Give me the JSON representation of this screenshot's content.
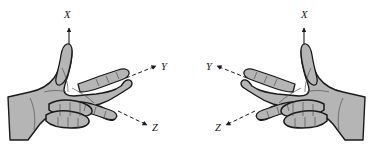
{
  "figure": {
    "background_color": "#ffffff",
    "hand_fill_color": "#b5b5b5",
    "hand_shade_color": "#9a9a9a",
    "outline_color": "#1a1a1a",
    "label_color": "#111111",
    "panels": [
      {
        "id": "left-panel",
        "hand": "left-oriented-hand",
        "axes": [
          {
            "id": "x",
            "label": "X",
            "direction": "up",
            "arrow_style": "solid-line-up",
            "label_x": 68,
            "label_y": 14
          },
          {
            "id": "y",
            "label": "Y",
            "direction": "upper-right",
            "arrow_style": "dashed-line-arrow",
            "label_x": 163,
            "label_y": 72
          },
          {
            "id": "z",
            "label": "Z",
            "direction": "lower-right",
            "arrow_style": "dashed-line-arrow",
            "label_x": 154,
            "label_y": 129
          }
        ]
      },
      {
        "id": "right-panel",
        "hand": "right-oriented-hand",
        "axes": [
          {
            "id": "x",
            "label": "X",
            "direction": "up",
            "arrow_style": "solid-line-up",
            "label_x": 305,
            "label_y": 14
          },
          {
            "id": "y",
            "label": "Y",
            "direction": "upper-left",
            "arrow_style": "dashed-line-arrow",
            "label_x": 210,
            "label_y": 72
          },
          {
            "id": "z",
            "label": "Z",
            "direction": "lower-left",
            "arrow_style": "dashed-line-arrow",
            "label_x": 219,
            "label_y": 129
          }
        ]
      }
    ]
  }
}
